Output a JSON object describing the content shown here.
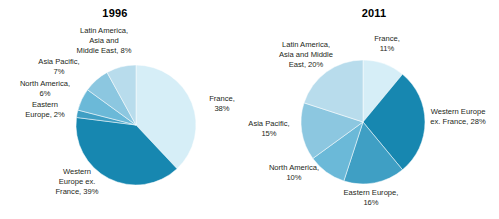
{
  "chart_data": [
    {
      "type": "pie",
      "title": "1996",
      "xlabel": "",
      "ylabel": "",
      "legend_position": "none",
      "grid": false,
      "categories": [
        "France",
        "Western Europe ex. France",
        "Eastern Europe",
        "North America",
        "Asia Pacific",
        "Latin America, Asia and Middle East"
      ],
      "values": [
        38,
        39,
        2,
        6,
        7,
        8
      ],
      "labels": [
        "France,\n38%",
        "Western\nEurope ex.\nFrance, 39%",
        "Eastern\nEurope, 2%",
        "North America,\n6%",
        "Asia Pacific,\n7%",
        "Latin America,\nAsia and\nMiddle East, 8%"
      ],
      "colors": [
        "#d6eef7",
        "#1787b0",
        "#3f9fc4",
        "#6bb9d8",
        "#8cc7e0",
        "#b8dcec"
      ],
      "start_angle_deg": 0,
      "direction": "clockwise"
    },
    {
      "type": "pie",
      "title": "2011",
      "xlabel": "",
      "ylabel": "",
      "legend_position": "none",
      "grid": false,
      "categories": [
        "France",
        "Western Europe ex. France",
        "Eastern Europe",
        "North America",
        "Asia Pacific",
        "Latin America, Asia and Middle East"
      ],
      "values": [
        11,
        28,
        16,
        10,
        15,
        20
      ],
      "labels": [
        "France,\n11%",
        "Western Europe\nex. France, 28%",
        "Eastern Europe,\n16%",
        "North America,\n10%",
        "Asia Pacific,\n15%",
        "Latin America,\nAsia and Middle\nEast, 20%"
      ],
      "colors": [
        "#d6eef7",
        "#1787b0",
        "#3f9fc4",
        "#6bb9d8",
        "#8cc7e0",
        "#b8dcec"
      ],
      "start_angle_deg": 0,
      "direction": "clockwise"
    }
  ],
  "palette": {
    "lightest": "#d6eef7",
    "light": "#b8dcec",
    "mid_light": "#8cc7e0",
    "mid": "#6bb9d8",
    "mid_dark": "#3f9fc4",
    "darkest": "#1787b0",
    "text": "#231f20",
    "background": "#ffffff"
  }
}
